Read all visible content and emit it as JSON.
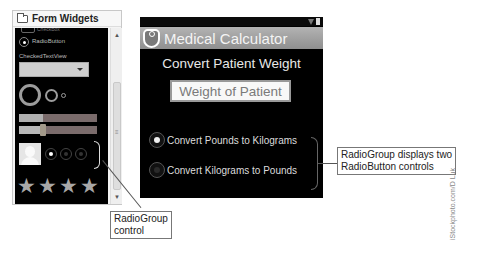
{
  "palette": {
    "title": "Form Widgets",
    "icon": "folder-icon",
    "items": {
      "checkbox_label": "CheckBox",
      "radiobutton_label": "RadioButton",
      "checkedtextview_label": "CheckedTextView"
    },
    "stars_count": 4,
    "mini_radio_group": [
      "checked",
      "unchecked",
      "unchecked"
    ]
  },
  "phone": {
    "app_title": "Medical Calculator",
    "heading": "Convert Patient Weight",
    "weight_input": {
      "value": "",
      "placeholder": "Weight of Patient"
    },
    "radio_group": [
      {
        "label": "Convert Pounds to Kilograms",
        "checked": true
      },
      {
        "label": "Convert Kilograms to Pounds",
        "checked": false
      }
    ]
  },
  "callouts": {
    "right_line1": "RadioGroup displays two",
    "right_line2": "RadioButton controls",
    "left_line1": "RadioGroup",
    "left_line2": "control"
  },
  "credit": "iStockphoto.com/D Luk"
}
